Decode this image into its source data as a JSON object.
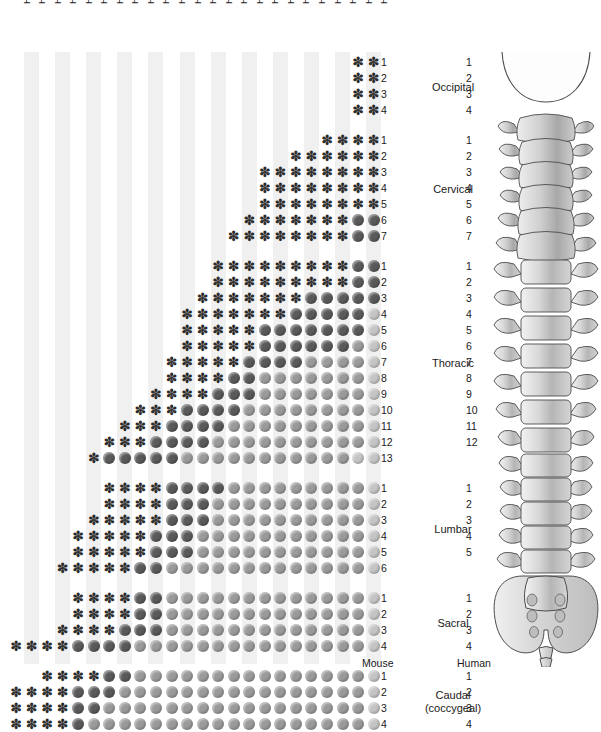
{
  "figure": {
    "species_left": "Mouse",
    "species_right": "Human"
  },
  "columns": [
    {
      "index": 0,
      "label": "Hoxd - 13"
    },
    {
      "index": 1,
      "label": "Hoxd - 12"
    },
    {
      "index": 2,
      "label": "Hoxa - 11"
    },
    {
      "index": 3,
      "label": "Hoxd - 11"
    },
    {
      "index": 4,
      "label": "Hoxd - 10"
    },
    {
      "index": 5,
      "label": "Hoxd - 9"
    },
    {
      "index": 6,
      "label": "Hoxa - 10"
    },
    {
      "index": 7,
      "label": "Hoxd - 8"
    },
    {
      "index": 8,
      "label": "Hoxc - 9"
    },
    {
      "index": 9,
      "label": "Hoxc - 8"
    },
    {
      "index": 10,
      "label": "Hoxb - 9"
    },
    {
      "index": 11,
      "label": "Hoxb - 7"
    },
    {
      "index": 12,
      "label": "Hoxa - 7"
    },
    {
      "index": 13,
      "label": "Hoxa - 6"
    },
    {
      "index": 14,
      "label": "Hoxc - 6"
    },
    {
      "index": 15,
      "label": "Hoxc - 5"
    },
    {
      "index": 16,
      "label": "Hoxa - 5"
    },
    {
      "index": 17,
      "label": "Hoxb - 5"
    },
    {
      "index": 18,
      "label": "Hoxa - 4"
    },
    {
      "index": 19,
      "label": "Hoxb - 4"
    },
    {
      "index": 20,
      "label": "Hoxd - 4"
    },
    {
      "index": 21,
      "label": "Hoxa - 3"
    },
    {
      "index": 22,
      "label": "Hoxa - 1"
    },
    {
      "index": 23,
      "label": "Hoxb - 1"
    }
  ],
  "regions": [
    {
      "name": "Occipital",
      "mouse_count": 4,
      "human_count": 4
    },
    {
      "name": "Cervical",
      "mouse_count": 7,
      "human_count": 7
    },
    {
      "name": "Thoracic",
      "mouse_count": 13,
      "human_count": 12
    },
    {
      "name": "Lumbar",
      "mouse_count": 6,
      "human_count": 5
    },
    {
      "name": "Sacral",
      "mouse_count": 4,
      "human_count": 4
    },
    {
      "name": "Caudal\n(coccygeal)",
      "mouse_count": 4,
      "human_count": 4,
      "name_line1": "Caudal",
      "name_line2": "(coccygeal)"
    }
  ],
  "legend": {
    "mark_asterisk": "asterisk-mark",
    "mark_dot_dark": "dark-dot-mark",
    "mark_dot_mid": "mid-dot-mark",
    "mark_dot_light": "light-dot-mark"
  },
  "chart_data": {
    "type": "heatmap",
    "xlabel": "Hox gene",
    "ylabel": "Vertebra",
    "grid": false,
    "legend_position": "none",
    "x_tick_labels": [
      "Hoxd - 13",
      "Hoxd - 12",
      "Hoxa - 11",
      "Hoxd - 11",
      "Hoxd - 10",
      "Hoxd - 9",
      "Hoxa - 10",
      "Hoxd - 8",
      "Hoxc - 9",
      "Hoxc - 8",
      "Hoxb - 9",
      "Hoxb - 7",
      "Hoxa - 7",
      "Hoxa - 6",
      "Hoxc - 6",
      "Hoxc - 5",
      "Hoxa - 5",
      "Hoxb - 5",
      "Hoxa - 4",
      "Hoxb - 4",
      "Hoxd - 4",
      "Hoxa - 3",
      "Hoxa - 1",
      "Hoxb - 1"
    ],
    "y_tick_labels": [
      "O1",
      "O2",
      "O3",
      "O4",
      "C1",
      "C2",
      "C3",
      "C4",
      "C5",
      "C6",
      "C7",
      "T1",
      "T2",
      "T3",
      "T4",
      "T5",
      "T6",
      "T7",
      "T8",
      "T9",
      "T10",
      "T11",
      "T12",
      "T13",
      "L1",
      "L2",
      "L3",
      "L4",
      "L5",
      "L6",
      "S1",
      "S2",
      "S3",
      "S4",
      "Ca1",
      "Ca2",
      "Ca3",
      "Ca4"
    ],
    "value_codes": {
      "0": "none",
      "1": "asterisk",
      "2": "dark",
      "3": "mid",
      "4": "light"
    },
    "rows": [
      {
        "row": "O1",
        "start_col": 22,
        "values": [
          0,
          0,
          0,
          0,
          0,
          0,
          0,
          0,
          0,
          0,
          0,
          0,
          0,
          0,
          0,
          0,
          0,
          0,
          0,
          0,
          0,
          0,
          1,
          1
        ]
      },
      {
        "row": "O2",
        "start_col": 22,
        "values": [
          0,
          0,
          0,
          0,
          0,
          0,
          0,
          0,
          0,
          0,
          0,
          0,
          0,
          0,
          0,
          0,
          0,
          0,
          0,
          0,
          0,
          0,
          1,
          1
        ]
      },
      {
        "row": "O3",
        "start_col": 22,
        "values": [
          0,
          0,
          0,
          0,
          0,
          0,
          0,
          0,
          0,
          0,
          0,
          0,
          0,
          0,
          0,
          0,
          0,
          0,
          0,
          0,
          0,
          0,
          1,
          1
        ]
      },
      {
        "row": "O4",
        "start_col": 22,
        "values": [
          0,
          0,
          0,
          0,
          0,
          0,
          0,
          0,
          0,
          0,
          0,
          0,
          0,
          0,
          0,
          0,
          0,
          0,
          0,
          0,
          0,
          0,
          1,
          1
        ]
      },
      {
        "row": "C1",
        "start_col": 20,
        "values": [
          0,
          0,
          0,
          0,
          0,
          0,
          0,
          0,
          0,
          0,
          0,
          0,
          0,
          0,
          0,
          0,
          0,
          0,
          0,
          0,
          1,
          1,
          1,
          1
        ]
      },
      {
        "row": "C2",
        "start_col": 18,
        "values": [
          0,
          0,
          0,
          0,
          0,
          0,
          0,
          0,
          0,
          0,
          0,
          0,
          0,
          0,
          0,
          0,
          0,
          0,
          1,
          1,
          1,
          1,
          1,
          1
        ]
      },
      {
        "row": "C3",
        "start_col": 16,
        "values": [
          0,
          0,
          0,
          0,
          0,
          0,
          0,
          0,
          0,
          0,
          0,
          0,
          0,
          0,
          0,
          0,
          1,
          1,
          1,
          1,
          1,
          1,
          1,
          1
        ]
      },
      {
        "row": "C4",
        "start_col": 16,
        "values": [
          0,
          0,
          0,
          0,
          0,
          0,
          0,
          0,
          0,
          0,
          0,
          0,
          0,
          0,
          0,
          0,
          1,
          1,
          1,
          1,
          1,
          1,
          1,
          1
        ]
      },
      {
        "row": "C5",
        "start_col": 16,
        "values": [
          0,
          0,
          0,
          0,
          0,
          0,
          0,
          0,
          0,
          0,
          0,
          0,
          0,
          0,
          0,
          0,
          1,
          1,
          1,
          1,
          1,
          1,
          1,
          1
        ]
      },
      {
        "row": "C6",
        "start_col": 15,
        "values": [
          0,
          0,
          0,
          0,
          0,
          0,
          0,
          0,
          0,
          0,
          0,
          0,
          0,
          0,
          0,
          1,
          1,
          1,
          1,
          1,
          1,
          1,
          2,
          2
        ]
      },
      {
        "row": "C7",
        "start_col": 14,
        "values": [
          0,
          0,
          0,
          0,
          0,
          0,
          0,
          0,
          0,
          0,
          0,
          0,
          0,
          0,
          1,
          1,
          1,
          1,
          1,
          1,
          1,
          1,
          2,
          2
        ]
      },
      {
        "row": "T1",
        "start_col": 13,
        "values": [
          0,
          0,
          0,
          0,
          0,
          0,
          0,
          0,
          0,
          0,
          0,
          0,
          0,
          1,
          1,
          1,
          1,
          1,
          1,
          1,
          1,
          1,
          2,
          2
        ]
      },
      {
        "row": "T2",
        "start_col": 13,
        "values": [
          0,
          0,
          0,
          0,
          0,
          0,
          0,
          0,
          0,
          0,
          0,
          0,
          0,
          1,
          1,
          1,
          1,
          1,
          1,
          1,
          1,
          1,
          2,
          2
        ]
      },
      {
        "row": "T3",
        "start_col": 12,
        "values": [
          0,
          0,
          0,
          0,
          0,
          0,
          0,
          0,
          0,
          0,
          0,
          0,
          1,
          1,
          1,
          1,
          1,
          1,
          1,
          2,
          2,
          2,
          2,
          2
        ]
      },
      {
        "row": "T4",
        "start_col": 11,
        "values": [
          0,
          0,
          0,
          0,
          0,
          0,
          0,
          0,
          0,
          0,
          0,
          1,
          1,
          1,
          1,
          1,
          1,
          1,
          2,
          2,
          2,
          2,
          2,
          4
        ]
      },
      {
        "row": "T5",
        "start_col": 11,
        "values": [
          0,
          0,
          0,
          0,
          0,
          0,
          0,
          0,
          0,
          0,
          0,
          1,
          1,
          1,
          1,
          1,
          2,
          2,
          2,
          2,
          2,
          2,
          2,
          4
        ]
      },
      {
        "row": "T6",
        "start_col": 11,
        "values": [
          0,
          0,
          0,
          0,
          0,
          0,
          0,
          0,
          0,
          0,
          0,
          1,
          1,
          1,
          1,
          1,
          2,
          2,
          2,
          2,
          2,
          2,
          3,
          4
        ]
      },
      {
        "row": "T7",
        "start_col": 10,
        "values": [
          0,
          0,
          0,
          0,
          0,
          0,
          0,
          0,
          0,
          0,
          1,
          1,
          1,
          1,
          1,
          2,
          2,
          2,
          2,
          3,
          3,
          3,
          3,
          4
        ]
      },
      {
        "row": "T8",
        "start_col": 10,
        "values": [
          0,
          0,
          0,
          0,
          0,
          0,
          0,
          0,
          0,
          0,
          1,
          1,
          1,
          1,
          2,
          2,
          3,
          3,
          3,
          3,
          3,
          3,
          3,
          4
        ]
      },
      {
        "row": "T9",
        "start_col": 9,
        "values": [
          0,
          0,
          0,
          0,
          0,
          0,
          0,
          0,
          0,
          1,
          1,
          1,
          1,
          2,
          2,
          2,
          3,
          3,
          3,
          3,
          3,
          3,
          3,
          4
        ]
      },
      {
        "row": "T10",
        "start_col": 8,
        "values": [
          0,
          0,
          0,
          0,
          0,
          0,
          0,
          0,
          1,
          1,
          1,
          2,
          2,
          2,
          2,
          3,
          3,
          3,
          3,
          3,
          3,
          3,
          3,
          4
        ]
      },
      {
        "row": "T11",
        "start_col": 7,
        "values": [
          0,
          0,
          0,
          0,
          0,
          0,
          0,
          1,
          1,
          1,
          2,
          2,
          2,
          2,
          3,
          3,
          3,
          3,
          3,
          3,
          3,
          3,
          3,
          4
        ]
      },
      {
        "row": "T12",
        "start_col": 6,
        "values": [
          0,
          0,
          0,
          0,
          0,
          0,
          1,
          1,
          1,
          2,
          2,
          2,
          2,
          3,
          3,
          3,
          3,
          3,
          3,
          3,
          3,
          3,
          3,
          4
        ]
      },
      {
        "row": "T13",
        "start_col": 5,
        "values": [
          0,
          0,
          0,
          0,
          0,
          1,
          2,
          2,
          2,
          2,
          2,
          3,
          3,
          3,
          3,
          3,
          3,
          3,
          3,
          3,
          3,
          3,
          4,
          4
        ]
      },
      {
        "row": "L1",
        "start_col": 6,
        "values": [
          0,
          0,
          0,
          0,
          0,
          0,
          1,
          1,
          1,
          1,
          2,
          2,
          2,
          2,
          3,
          3,
          3,
          3,
          3,
          3,
          3,
          3,
          3,
          4
        ]
      },
      {
        "row": "L2",
        "start_col": 6,
        "values": [
          0,
          0,
          0,
          0,
          0,
          0,
          1,
          1,
          1,
          1,
          2,
          2,
          2,
          3,
          3,
          3,
          3,
          3,
          3,
          3,
          3,
          3,
          3,
          4
        ]
      },
      {
        "row": "L3",
        "start_col": 5,
        "values": [
          0,
          0,
          0,
          0,
          0,
          1,
          1,
          1,
          1,
          1,
          2,
          2,
          2,
          3,
          3,
          3,
          3,
          3,
          3,
          3,
          3,
          3,
          3,
          4
        ]
      },
      {
        "row": "L4",
        "start_col": 4,
        "values": [
          0,
          0,
          0,
          0,
          1,
          1,
          1,
          1,
          1,
          2,
          2,
          2,
          3,
          3,
          3,
          3,
          3,
          3,
          3,
          3,
          3,
          3,
          3,
          4
        ]
      },
      {
        "row": "L5",
        "start_col": 4,
        "values": [
          0,
          0,
          0,
          0,
          1,
          1,
          1,
          1,
          1,
          2,
          2,
          2,
          3,
          3,
          3,
          3,
          3,
          3,
          3,
          3,
          3,
          3,
          3,
          4
        ]
      },
      {
        "row": "L6",
        "start_col": 3,
        "values": [
          0,
          0,
          0,
          1,
          1,
          1,
          1,
          1,
          2,
          2,
          3,
          3,
          3,
          3,
          3,
          3,
          3,
          3,
          3,
          3,
          3,
          3,
          3,
          4
        ]
      },
      {
        "row": "S1",
        "start_col": 4,
        "values": [
          0,
          0,
          0,
          0,
          1,
          1,
          1,
          1,
          2,
          2,
          3,
          3,
          3,
          3,
          3,
          3,
          3,
          3,
          3,
          3,
          3,
          3,
          3,
          4
        ]
      },
      {
        "row": "S2",
        "start_col": 4,
        "values": [
          0,
          0,
          0,
          0,
          1,
          1,
          1,
          1,
          2,
          2,
          3,
          3,
          3,
          3,
          3,
          3,
          3,
          3,
          3,
          3,
          3,
          3,
          3,
          4
        ]
      },
      {
        "row": "S3",
        "start_col": 3,
        "values": [
          0,
          0,
          0,
          1,
          1,
          1,
          1,
          2,
          2,
          2,
          3,
          3,
          3,
          3,
          3,
          3,
          3,
          3,
          3,
          3,
          3,
          3,
          3,
          4
        ]
      },
      {
        "row": "S4",
        "start_col": 0,
        "values": [
          1,
          1,
          1,
          1,
          2,
          2,
          2,
          2,
          3,
          3,
          3,
          3,
          3,
          3,
          3,
          3,
          3,
          3,
          3,
          3,
          3,
          3,
          3,
          4
        ]
      },
      {
        "row": "Ca1",
        "start_col": 2,
        "values": [
          0,
          0,
          1,
          1,
          1,
          1,
          2,
          2,
          3,
          3,
          3,
          3,
          3,
          3,
          3,
          3,
          3,
          3,
          3,
          3,
          3,
          3,
          3,
          4
        ]
      },
      {
        "row": "Ca2",
        "start_col": 0,
        "values": [
          1,
          1,
          1,
          1,
          2,
          2,
          2,
          3,
          3,
          3,
          3,
          3,
          3,
          3,
          3,
          3,
          3,
          3,
          3,
          3,
          3,
          3,
          3,
          4
        ]
      },
      {
        "row": "Ca3",
        "start_col": 0,
        "values": [
          1,
          1,
          1,
          1,
          2,
          2,
          3,
          3,
          3,
          3,
          3,
          3,
          3,
          3,
          3,
          3,
          3,
          3,
          3,
          3,
          3,
          3,
          3,
          4
        ]
      },
      {
        "row": "Ca4",
        "start_col": 0,
        "values": [
          1,
          1,
          1,
          1,
          2,
          3,
          3,
          3,
          3,
          3,
          3,
          3,
          3,
          3,
          3,
          3,
          3,
          3,
          3,
          3,
          3,
          3,
          3,
          4
        ]
      }
    ]
  },
  "colors": {
    "asterisk": "#2b2b2b",
    "dot_dark": "#5a5a5a",
    "dot_mid": "#9a9a9a",
    "dot_light": "#c4c4c4",
    "band": "#f0f0f0",
    "text": "#1a1a1a",
    "bone_outline": "#555555",
    "bone_fill": "#d0d0d0"
  }
}
